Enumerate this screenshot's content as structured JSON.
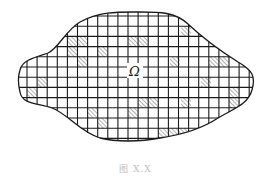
{
  "diagram": {
    "type": "domain-grid-partition",
    "region_label": "Ω",
    "caption": "图 X.X",
    "colors": {
      "grid_line": "#1a1a1a",
      "boundary": "#1a1a1a",
      "hatch": "#7a7a7a",
      "hatch_bg": "#ffffff",
      "background": "#ffffff"
    },
    "grid": {
      "x0": 27,
      "y0": 16,
      "cell_w": 10.1,
      "cell_h": 10.2,
      "cols": 23,
      "rows": 13
    },
    "hatched_cells": [
      {
        "x": 67,
        "y": 37
      },
      {
        "x": 77,
        "y": 37
      },
      {
        "x": 67,
        "y": 47
      },
      {
        "x": 97,
        "y": 47
      },
      {
        "x": 77,
        "y": 57
      },
      {
        "x": 128,
        "y": 37
      },
      {
        "x": 138,
        "y": 37
      },
      {
        "x": 181,
        "y": 26
      },
      {
        "x": 170,
        "y": 57
      },
      {
        "x": 209,
        "y": 57
      },
      {
        "x": 219,
        "y": 57
      },
      {
        "x": 201,
        "y": 77
      },
      {
        "x": 38,
        "y": 77
      },
      {
        "x": 27,
        "y": 88
      },
      {
        "x": 229,
        "y": 88
      },
      {
        "x": 229,
        "y": 98
      },
      {
        "x": 138,
        "y": 98
      },
      {
        "x": 148,
        "y": 98
      },
      {
        "x": 181,
        "y": 98
      },
      {
        "x": 87,
        "y": 108
      },
      {
        "x": 128,
        "y": 108
      },
      {
        "x": 97,
        "y": 118
      },
      {
        "x": 158,
        "y": 128
      },
      {
        "x": 168,
        "y": 128
      },
      {
        "x": 178,
        "y": 128
      }
    ]
  }
}
